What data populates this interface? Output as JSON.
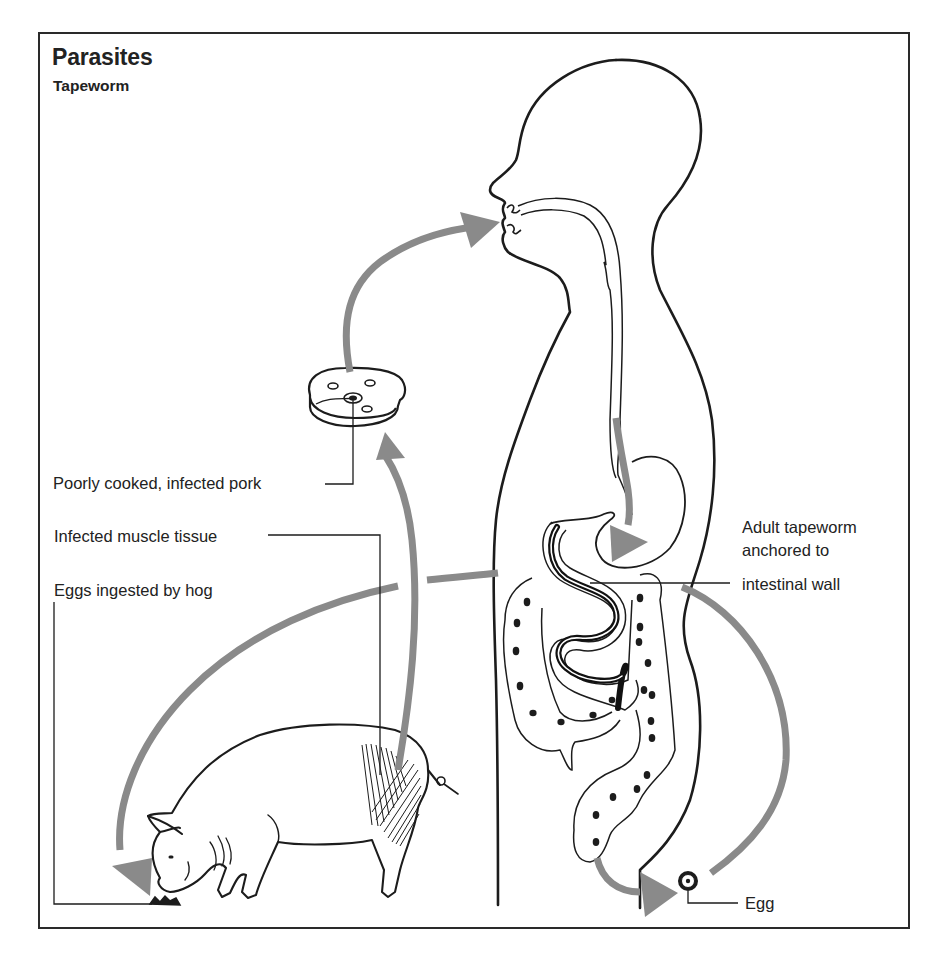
{
  "diagram": {
    "title": "Parasites",
    "subtitle": "Tapeworm",
    "labels": {
      "pork": "Poorly cooked, infected pork",
      "muscle": "Infected muscle tissue",
      "eggs_hog": "Eggs ingested by hog",
      "adult_line1": "Adult tapeworm",
      "adult_line2": "anchored to",
      "adult_line3": "intestinal wall",
      "egg": "Egg"
    },
    "nodes": [
      "Human host",
      "Adult tapeworm in intestine",
      "Egg expelled",
      "Hog ingests eggs",
      "Infected muscle tissue",
      "Poorly cooked, infected pork",
      "Eaten by human"
    ],
    "colors": {
      "line": "#1c1c1c",
      "arrow": "#8a8a8a",
      "frame": "#2a2a2a",
      "background": "#ffffff"
    }
  }
}
